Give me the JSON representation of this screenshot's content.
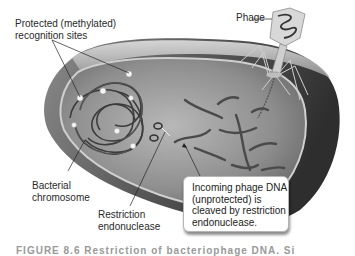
{
  "labels": {
    "protected_sites_line1": "Protected (methylated)",
    "protected_sites_line2": "recognition sites",
    "phage": "Phage",
    "bacterial_chromosome_line1": "Bacterial",
    "bacterial_chromosome_line2": "chromosome",
    "restriction_endonuclease_line1": "Restriction",
    "restriction_endonuclease_line2": "endonuclease",
    "callout_line1": "Incoming phage DNA",
    "callout_line2": "(unprotected) is",
    "callout_line3": "cleaved by restriction",
    "callout_line4": "endonuclease."
  },
  "caption": "FIGURE 8.6   Restriction of bacteriophage DNA. Si",
  "colors": {
    "cell_outer": "#3a3a3a",
    "cell_inner": "#7a7a7a",
    "membrane": "#c9c9c9",
    "dna": "#4a4a4a",
    "site": "#f0f0f0"
  }
}
